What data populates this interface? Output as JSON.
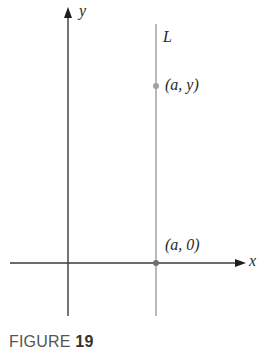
{
  "figure": {
    "caption_prefix": "FIGURE",
    "caption_number": "19",
    "axes": {
      "x_label": "x",
      "y_label": "y"
    },
    "line": {
      "label": "L",
      "color": "#a8a8a8"
    },
    "points": [
      {
        "label": "(a, y)",
        "color": "#a0a0a0"
      },
      {
        "label": "(a, 0)",
        "color": "#707070"
      }
    ],
    "colors": {
      "axis": "#3a3a3a",
      "line_L": "#a8a8a8",
      "text": "#2a2a2a",
      "caption": "#555555"
    }
  }
}
